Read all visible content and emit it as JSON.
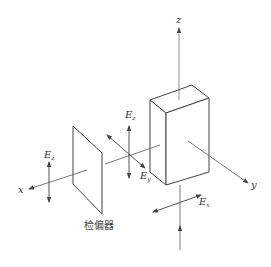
{
  "diagram": {
    "type": "optics-setup",
    "axes": {
      "x_label": "x",
      "y_label": "y",
      "z_label": "z"
    },
    "labels": {
      "polarizer_field": {
        "main": "E",
        "sub": "z"
      },
      "center_field_z": {
        "main": "E",
        "sub": "z"
      },
      "center_field_y": {
        "main": "E",
        "sub": "y"
      },
      "input_field_x": {
        "main": "E",
        "sub": "x"
      },
      "analyzer": "检偏器"
    },
    "colors": {
      "line": "#444444",
      "axis": "#666666",
      "background": "#ffffff"
    }
  }
}
